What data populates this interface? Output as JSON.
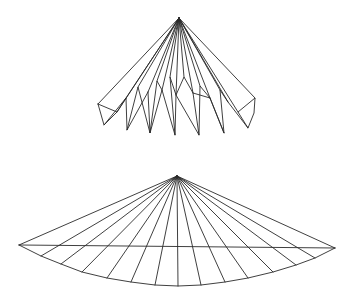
{
  "canvas": {
    "width": 351,
    "height": 295,
    "background": "#ffffff",
    "stroke": "#2a2a2a"
  },
  "figures": [
    {
      "id": "folded-fan",
      "apex": [
        179,
        18
      ],
      "apex_rays_to": [
        [
          98,
          104
        ],
        [
          117,
          112
        ],
        [
          126,
          98
        ],
        [
          138,
          87
        ],
        [
          148,
          92
        ],
        [
          157,
          81
        ],
        [
          162,
          90
        ],
        [
          170,
          77
        ],
        [
          176,
          95
        ],
        [
          184,
          77
        ],
        [
          193,
          93
        ],
        [
          200,
          86
        ],
        [
          210,
          98
        ],
        [
          220,
          90
        ],
        [
          228,
          102
        ],
        [
          238,
          112
        ],
        [
          255,
          98
        ]
      ],
      "polylines": [
        [
          [
            98,
            104
          ],
          [
            117,
            112
          ],
          [
            104,
            125
          ],
          [
            98,
            104
          ]
        ],
        [
          [
            104,
            125
          ],
          [
            126,
            98
          ],
          [
            127,
            130
          ],
          [
            138,
            87
          ],
          [
            150,
            133
          ],
          [
            157,
            81
          ],
          [
            162,
            90
          ]
        ],
        [
          [
            148,
            92
          ],
          [
            150,
            133
          ],
          [
            162,
            90
          ],
          [
            175,
            135
          ],
          [
            170,
            77
          ],
          [
            176,
            95
          ],
          [
            184,
            77
          ],
          [
            193,
            93
          ],
          [
            199,
            135
          ],
          [
            176,
            95
          ],
          [
            175,
            135
          ]
        ],
        [
          [
            199,
            135
          ],
          [
            200,
            86
          ],
          [
            210,
            98
          ],
          [
            224,
            133
          ],
          [
            220,
            90
          ],
          [
            228,
            102
          ],
          [
            248,
            128
          ],
          [
            238,
            112
          ],
          [
            255,
            98
          ],
          [
            254,
            113
          ],
          [
            248,
            128
          ]
        ],
        [
          [
            193,
            93
          ],
          [
            210,
            98
          ]
        ],
        [
          [
            224,
            133
          ],
          [
            210,
            98
          ]
        ],
        [
          [
            117,
            112
          ],
          [
            126,
            98
          ]
        ],
        [
          [
            127,
            130
          ],
          [
            148,
            92
          ]
        ]
      ]
    },
    {
      "id": "flat-fan",
      "apex": [
        177,
        176
      ],
      "chord": [
        [
          19,
          245
        ],
        [
          335,
          248
        ]
      ],
      "rim_points": [
        [
          19,
          245
        ],
        [
          41,
          256
        ],
        [
          61,
          264
        ],
        [
          82,
          272
        ],
        [
          107,
          278
        ],
        [
          131,
          282
        ],
        [
          155,
          285
        ],
        [
          178,
          286
        ],
        [
          201,
          285
        ],
        [
          225,
          282
        ],
        [
          248,
          278
        ],
        [
          273,
          272
        ],
        [
          296,
          265
        ],
        [
          315,
          258
        ],
        [
          335,
          248
        ]
      ]
    }
  ]
}
